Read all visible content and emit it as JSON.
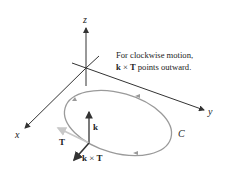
{
  "figure": {
    "axes": {
      "x_label": "x",
      "y_label": "y",
      "z_label": "z"
    },
    "annotation": {
      "line1": "For clockwise motion,",
      "line2_bold": "k",
      "line2_op": " × ",
      "line2_bold2": "T",
      "line2_rest": " points outward."
    },
    "curve_label": "C",
    "vectors": {
      "k": "k",
      "T": "T",
      "kxT_a": "k",
      "kxT_op": " × ",
      "kxT_b": "T"
    },
    "colors": {
      "axes": "#333333",
      "curve": "#9a9a9a",
      "vector_dark": "#333333",
      "vector_light": "#c8c8c8"
    }
  }
}
